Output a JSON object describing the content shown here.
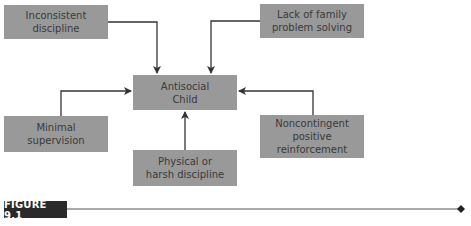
{
  "diagram": {
    "center": {
      "label": "Antisocial\nChild"
    },
    "factors": [
      {
        "id": "inconsistent-discipline",
        "label": "Inconsistent\ndiscipline"
      },
      {
        "id": "lack-of-family-problem-solving",
        "label": "Lack of family\nproblem solving"
      },
      {
        "id": "minimal-supervision",
        "label": "Minimal\nsupervision"
      },
      {
        "id": "physical-or-harsh-discipline",
        "label": "Physical or\nharsh discipline"
      },
      {
        "id": "noncontingent-positive-reinforcement",
        "label": "Noncontingent\npositive\nreinforcement"
      }
    ],
    "edges": [
      {
        "from": "inconsistent-discipline",
        "to": "antisocial-child"
      },
      {
        "from": "lack-of-family-problem-solving",
        "to": "antisocial-child"
      },
      {
        "from": "minimal-supervision",
        "to": "antisocial-child"
      },
      {
        "from": "physical-or-harsh-discipline",
        "to": "antisocial-child"
      },
      {
        "from": "noncontingent-positive-reinforcement",
        "to": "antisocial-child"
      }
    ]
  },
  "caption": {
    "label": "FIGURE 9.1"
  },
  "colors": {
    "box_fill": "#999999",
    "box_text": "#3a3a3a",
    "arrow": "#333333",
    "label_bg": "#2a2a2a"
  }
}
